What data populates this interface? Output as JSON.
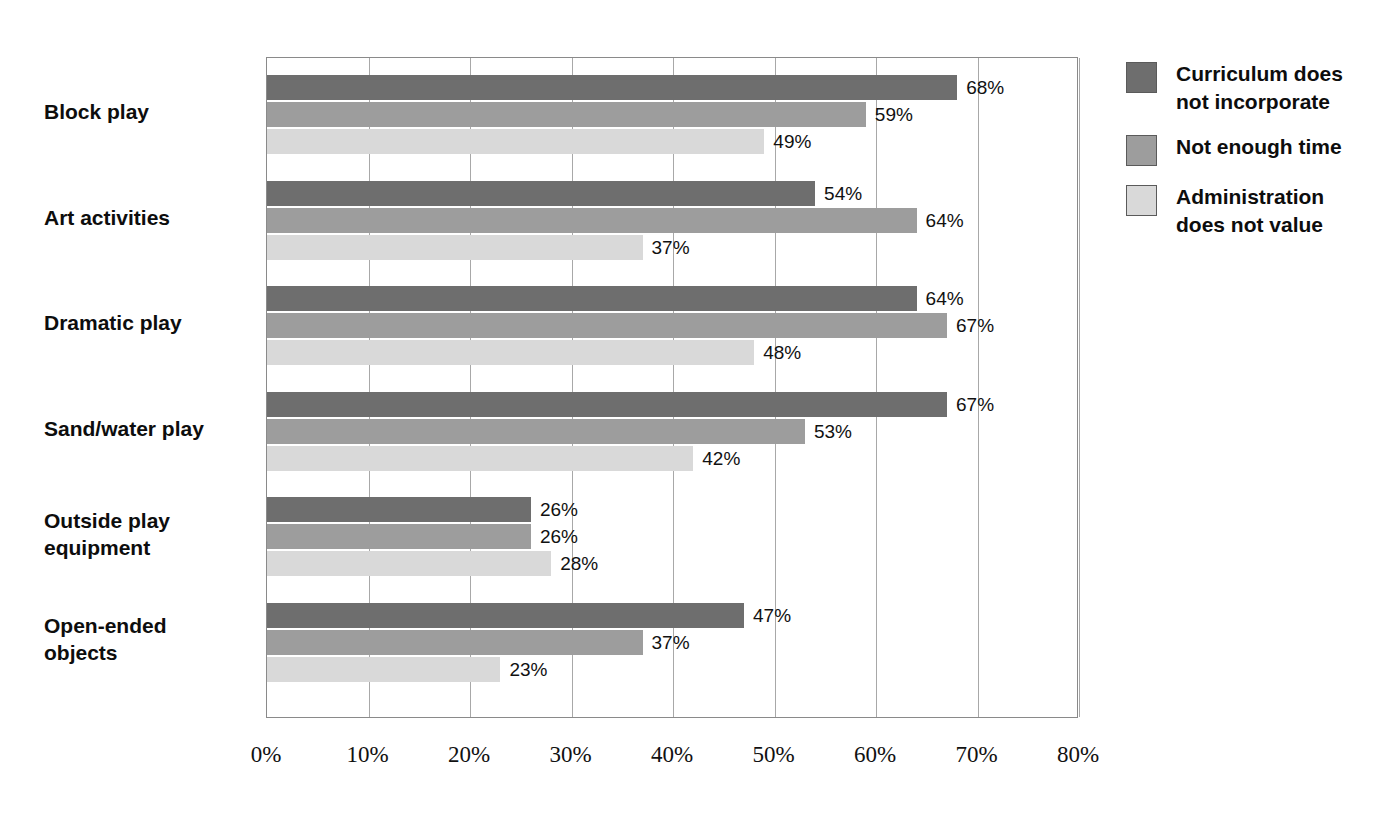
{
  "chart_data": {
    "type": "bar",
    "orientation": "horizontal",
    "title": "",
    "xlabel": "",
    "ylabel": "",
    "xlim": [
      0,
      80
    ],
    "xticks": [
      "0%",
      "10%",
      "20%",
      "30%",
      "40%",
      "50%",
      "60%",
      "70%",
      "80%"
    ],
    "xtick_values": [
      0,
      10,
      20,
      30,
      40,
      50,
      60,
      70,
      80
    ],
    "grid": true,
    "legend_position": "right",
    "value_label_suffix": "%",
    "categories": [
      "Block play",
      "Art activities",
      "Dramatic play",
      "Sand/water play",
      "Outside play equipment",
      "Open-ended objects"
    ],
    "series": [
      {
        "name": "Curriculum does not incorporate",
        "color": "#6e6e6e",
        "values": [
          68,
          54,
          64,
          67,
          26,
          47
        ],
        "labels": [
          "68%",
          "54%",
          "64%",
          "67%",
          "26%",
          "47%"
        ]
      },
      {
        "name": "Not enough time",
        "color": "#9d9d9d",
        "values": [
          59,
          64,
          67,
          53,
          26,
          37
        ],
        "labels": [
          "59%",
          "64%",
          "67%",
          "53%",
          "26%",
          "37%"
        ]
      },
      {
        "name": "Administration does not value",
        "color": "#d9d9d9",
        "values": [
          49,
          37,
          48,
          42,
          28,
          23
        ],
        "labels": [
          "49%",
          "37%",
          "48%",
          "42%",
          "28%",
          "23%"
        ]
      }
    ]
  },
  "legend": {
    "items": [
      {
        "label": "Curriculum does not incorporate",
        "color": "#6e6e6e"
      },
      {
        "label": "Not enough time",
        "color": "#9d9d9d"
      },
      {
        "label": "Administration does not value",
        "color": "#d9d9d9"
      }
    ]
  },
  "axis": {
    "colors": {
      "gridline": "#a8a8a8",
      "frame": "#8a8a8a",
      "text": "#111111"
    }
  }
}
